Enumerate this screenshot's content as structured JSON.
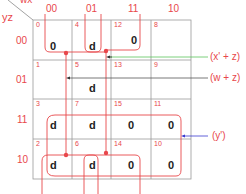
{
  "map": {
    "row_var": "yz",
    "col_var": "wx",
    "col_headers": [
      "00",
      "01",
      "11",
      "10"
    ],
    "row_headers": [
      "00",
      "01",
      "11",
      "10"
    ],
    "cells": [
      [
        {
          "idx": "0",
          "val": "0"
        },
        {
          "idx": "4",
          "val": "d"
        },
        {
          "idx": "12",
          "val": "0"
        },
        {
          "idx": "8",
          "val": ""
        }
      ],
      [
        {
          "idx": "1",
          "val": ""
        },
        {
          "idx": "5",
          "val": "d"
        },
        {
          "idx": "13",
          "val": ""
        },
        {
          "idx": "9",
          "val": ""
        }
      ],
      [
        {
          "idx": "3",
          "val": "d"
        },
        {
          "idx": "7",
          "val": "d"
        },
        {
          "idx": "15",
          "val": "0"
        },
        {
          "idx": "11",
          "val": "0"
        }
      ],
      [
        {
          "idx": "2",
          "val": "d"
        },
        {
          "idx": "6",
          "val": "d"
        },
        {
          "idx": "14",
          "val": "0"
        },
        {
          "idx": "10",
          "val": "0"
        }
      ]
    ]
  },
  "terms": {
    "t1": "(x' + z)",
    "t2": "(w + z)",
    "t3": "(y')"
  },
  "colors": {
    "accent": "#e8474b",
    "grid": "#8a8a8a",
    "arrow_green": "#5cc45c",
    "arrow_blue": "#3a3acf"
  }
}
